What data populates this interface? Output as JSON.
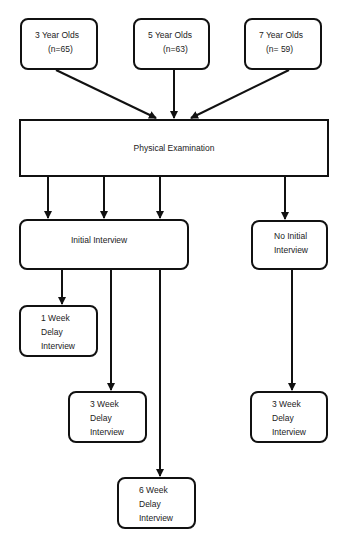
{
  "diagram": {
    "type": "flowchart",
    "nodes": {
      "age3": {
        "lines": [
          "3 Year Olds",
          "(n=65)"
        ]
      },
      "age5": {
        "lines": [
          "5 Year Olds",
          "(n=63)"
        ]
      },
      "age7": {
        "lines": [
          "7 Year Olds",
          "(n= 59)"
        ]
      },
      "physical": {
        "lines": [
          "Physical Examination"
        ]
      },
      "initial": {
        "lines": [
          "Initial Interview"
        ]
      },
      "noinitial": {
        "lines": [
          "No Initial",
          "Interview"
        ]
      },
      "week1": {
        "lines": [
          "1 Week",
          "Delay",
          "Interview"
        ]
      },
      "week3a": {
        "lines": [
          "3 Week",
          "Delay",
          "Interview"
        ]
      },
      "week3b": {
        "lines": [
          "3 Week",
          "Delay",
          "Interview"
        ]
      },
      "week6": {
        "lines": [
          "6 Week",
          "Delay",
          "Interview"
        ]
      }
    },
    "edges": [
      {
        "from": "age3",
        "to": "physical"
      },
      {
        "from": "age5",
        "to": "physical"
      },
      {
        "from": "age7",
        "to": "physical"
      },
      {
        "from": "physical",
        "to": "initial"
      },
      {
        "from": "physical",
        "to": "initial"
      },
      {
        "from": "physical",
        "to": "initial"
      },
      {
        "from": "physical",
        "to": "noinitial"
      },
      {
        "from": "initial",
        "to": "week1"
      },
      {
        "from": "initial",
        "to": "week3a"
      },
      {
        "from": "initial",
        "to": "week6"
      },
      {
        "from": "noinitial",
        "to": "week3b"
      }
    ],
    "colors": {
      "stroke": "#111111",
      "background": "#ffffff",
      "text": "#222222"
    }
  }
}
